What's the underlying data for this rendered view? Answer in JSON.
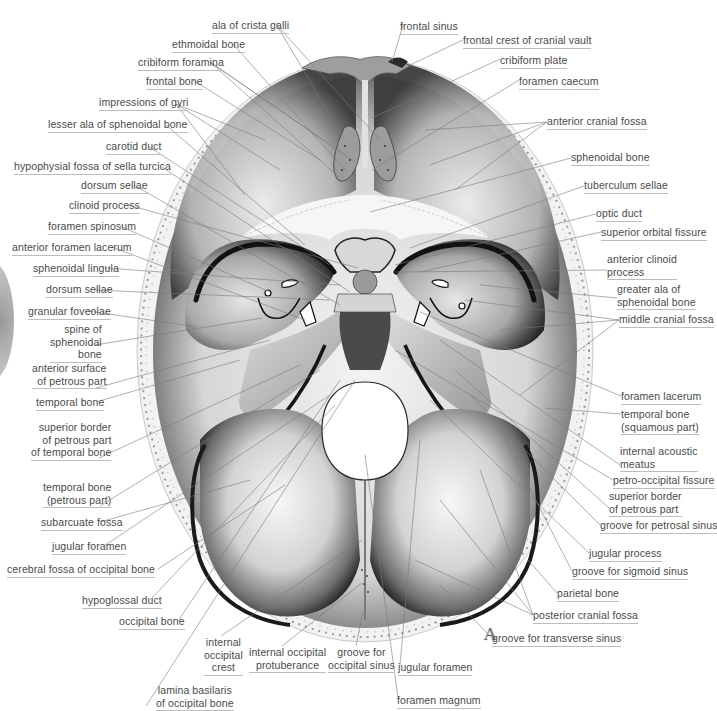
{
  "figure": {
    "letter": "A"
  },
  "labels_left": [
    {
      "id": "ala-of-crista-galli",
      "text": "ala of crista galli",
      "x": 212,
      "y": 19
    },
    {
      "id": "ethmoidal-bone",
      "text": "ethmoidal bone",
      "x": 172,
      "y": 38
    },
    {
      "id": "cribiform-foramina",
      "text": "cribiform foramina",
      "x": 138,
      "y": 56
    },
    {
      "id": "frontal-bone",
      "text": "frontal bone",
      "x": 146,
      "y": 75
    },
    {
      "id": "impressions-of-gyri",
      "text": "impressions of gyri",
      "x": 99,
      "y": 96
    },
    {
      "id": "lesser-ala-of-sphenoidal-bone",
      "text": "lesser ala of sphenoidal bone",
      "x": 48,
      "y": 118
    },
    {
      "id": "carotid-duct",
      "text": "carotid duct",
      "x": 106,
      "y": 140
    },
    {
      "id": "hypophysial-fossa",
      "text": "hypophysial fossa of sella turcica",
      "x": 14,
      "y": 160
    },
    {
      "id": "dorsum-sellae-1",
      "text": "dorsum sellae",
      "x": 81,
      "y": 179
    },
    {
      "id": "clinoid-process",
      "text": "clinoid process",
      "x": 69,
      "y": 199
    },
    {
      "id": "foramen-spinosum",
      "text": "foramen spinosum",
      "x": 48,
      "y": 220
    },
    {
      "id": "anterior-foramen-lacerum",
      "text": "anterior foramen lacerum",
      "x": 12,
      "y": 241
    },
    {
      "id": "sphenoidal-lingula",
      "text": "sphenoidal lingula",
      "x": 33,
      "y": 262
    },
    {
      "id": "dorsum-sellae-2",
      "text": "dorsum sellae",
      "x": 46,
      "y": 283
    },
    {
      "id": "granular-foveolae",
      "text": "granular foveolae",
      "x": 28,
      "y": 305
    },
    {
      "id": "spine-of-sphenoidal-bone",
      "text": "spine of\nsphenoidal\nbone",
      "x": 50,
      "y": 323,
      "align": "right",
      "w": 45
    },
    {
      "id": "anterior-surface-of-petrous-part",
      "text": "anterior surface\nof petrous part",
      "x": 32,
      "y": 362,
      "align": "right",
      "w": 64
    },
    {
      "id": "temporal-bone",
      "text": "temporal bone",
      "x": 36,
      "y": 396
    },
    {
      "id": "superior-border-of-petrous-part-of-temporal-bone",
      "text": "superior border\nof petrous part\nof temporal bone",
      "x": 31,
      "y": 421,
      "align": "right",
      "w": 68
    },
    {
      "id": "temporal-bone-petrous-part",
      "text": "temporal bone\n(petrous part)",
      "x": 43,
      "y": 481,
      "align": "right",
      "w": 57
    },
    {
      "id": "subarcuate-fossa",
      "text": "subarcuate fossa",
      "x": 41,
      "y": 516
    },
    {
      "id": "jugular-foramen-left",
      "text": "jugular foramen",
      "x": 52,
      "y": 540
    },
    {
      "id": "cerebral-fossa-of-occipital-bone",
      "text": "cerebral fossa of occipital bone",
      "x": 7,
      "y": 563
    },
    {
      "id": "hypoglossal-duct",
      "text": "hypoglossal duct",
      "x": 82,
      "y": 594
    },
    {
      "id": "occipital-bone",
      "text": "occipital bone",
      "x": 119,
      "y": 615
    }
  ],
  "labels_bottom": [
    {
      "id": "internal-occipital-crest",
      "text": "internal\noccipital\ncrest",
      "x": 204,
      "y": 636,
      "align": "center",
      "w": 34
    },
    {
      "id": "internal-occipital-protuberance",
      "text": "internal occipital\nprotuberance",
      "x": 249,
      "y": 646,
      "align": "center",
      "w": 66
    },
    {
      "id": "groove-for-occipital-sinus",
      "text": "groove for\noccipital sinus",
      "x": 328,
      "y": 646,
      "align": "center",
      "w": 56
    },
    {
      "id": "jugular-foramen-bottom",
      "text": "jugular foramen",
      "x": 398,
      "y": 661
    },
    {
      "id": "lamina-basilaris-of-occipital-bone",
      "text": "lamina basilaris\nof occipital bone",
      "x": 156,
      "y": 684,
      "align": "center",
      "w": 66
    },
    {
      "id": "foramen-magnum",
      "text": "foramen magnum",
      "x": 397,
      "y": 694
    }
  ],
  "labels_right": [
    {
      "id": "frontal-sinus",
      "text": "frontal sinus",
      "x": 400,
      "y": 20
    },
    {
      "id": "frontal-crest-of-cranial-vault",
      "text": "frontal crest of cranial vault",
      "x": 463,
      "y": 34
    },
    {
      "id": "cribiform-plate",
      "text": "cribiform plate",
      "x": 500,
      "y": 54
    },
    {
      "id": "foramen-caecum",
      "text": "foramen caecum",
      "x": 519,
      "y": 75
    },
    {
      "id": "anterior-cranial-fossa",
      "text": "anterior cranial fossa",
      "x": 547,
      "y": 115
    },
    {
      "id": "sphenoidal-bone",
      "text": "sphenoidal bone",
      "x": 571,
      "y": 151
    },
    {
      "id": "tuberculum-sellae",
      "text": "tuberculum sellae",
      "x": 584,
      "y": 179
    },
    {
      "id": "optic-duct",
      "text": "optic duct",
      "x": 596,
      "y": 207
    },
    {
      "id": "superior-orbital-fissure",
      "text": "superior orbital fissure",
      "x": 601,
      "y": 226
    },
    {
      "id": "anterior-clinoid-process",
      "text": "anterior clinoid\nprocess",
      "x": 607,
      "y": 253
    },
    {
      "id": "greater-ala-of-sphenoidal-bone",
      "text": "greater ala of\nsphenoidal bone",
      "x": 617,
      "y": 283
    },
    {
      "id": "middle-cranial-fossa",
      "text": "middle cranial fossa",
      "x": 619,
      "y": 313
    },
    {
      "id": "foramen-lacerum",
      "text": "foramen lacerum",
      "x": 621,
      "y": 390
    },
    {
      "id": "temporal-bone-squamous-part",
      "text": "temporal bone\n(squamous part)",
      "x": 621,
      "y": 408
    },
    {
      "id": "internal-acoustic-meatus",
      "text": "internal acoustic\nmeatus",
      "x": 620,
      "y": 445
    },
    {
      "id": "petro-occipital-fissure",
      "text": "petro-occipital fissure",
      "x": 613,
      "y": 474
    },
    {
      "id": "superior-border-of-petrous-part",
      "text": "superior border\nof petrous part",
      "x": 609,
      "y": 490
    },
    {
      "id": "groove-for-petrosal-sinus",
      "text": "groove for petrosal sinus",
      "x": 600,
      "y": 519
    },
    {
      "id": "jugular-process",
      "text": "jugular process",
      "x": 589,
      "y": 547
    },
    {
      "id": "groove-for-sigmoid-sinus",
      "text": "groove for sigmoid sinus",
      "x": 572,
      "y": 565
    },
    {
      "id": "parietal-bone",
      "text": "parietal bone",
      "x": 557,
      "y": 587
    },
    {
      "id": "posterior-cranial-fossa",
      "text": "posterior cranial fossa",
      "x": 533,
      "y": 609
    },
    {
      "id": "groove-for-transverse-sinus",
      "text": "groove for transverse sinus",
      "x": 492,
      "y": 632
    }
  ],
  "colors": {
    "background": "#ffffff",
    "label_text": "#4a4a4a",
    "leader_line": "#7a7a7a",
    "label_underline": "#bdbdbd",
    "bone_light": "#f2f2f2",
    "bone_mid": "#a8a8a8",
    "bone_dark": "#1e1e1e"
  }
}
